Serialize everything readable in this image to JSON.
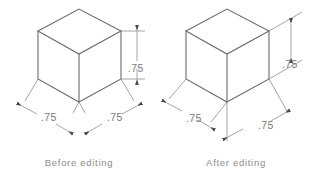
{
  "drawing": {
    "title": "Isometric cube dimension editing comparison",
    "background_color": "#ffffff",
    "object_line_color": "#6b6b6b",
    "dimension_line_color": "#8d8d8d",
    "arrow_color": "#4a4a4a",
    "text_color": "#7a7a7a",
    "caption_color": "#8a8a8a"
  },
  "panels": [
    {
      "id": "before",
      "caption": "Before  editing",
      "caption_x": 79,
      "caption_y": 166,
      "dimensions": [
        {
          "name": "height",
          "value": ".75",
          "text_x": 128,
          "text_y": 72,
          "orientation": "vertical",
          "placement": "inside"
        },
        {
          "name": "left-width",
          "value": ".75",
          "text_x": 41,
          "text_y": 121,
          "orientation": "iso-left",
          "placement": "inside"
        },
        {
          "name": "right-width",
          "value": ".75",
          "text_x": 107,
          "text_y": 121,
          "orientation": "iso-right",
          "placement": "inside"
        }
      ]
    },
    {
      "id": "after",
      "caption": "After  editing",
      "caption_x": 236,
      "caption_y": 166,
      "dimensions": [
        {
          "name": "height",
          "value": ".75",
          "text_x": 291,
          "text_y": 68,
          "orientation": "vertical",
          "placement": "offset"
        },
        {
          "name": "left-width",
          "value": ".75",
          "text_x": 189,
          "text_y": 122,
          "orientation": "iso-left",
          "placement": "offset"
        },
        {
          "name": "right-width",
          "value": ".75",
          "text_x": 264,
          "text_y": 130,
          "orientation": "iso-right",
          "placement": "offset"
        }
      ]
    }
  ]
}
